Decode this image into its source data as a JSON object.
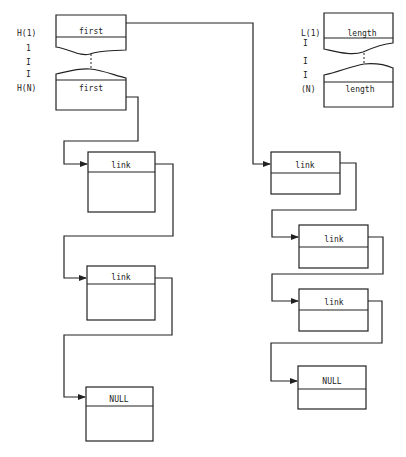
{
  "diagram": {
    "left_header": {
      "row_labels": [
        "H(1)",
        "1",
        "I",
        "I",
        "H(N)"
      ],
      "top_field": "first",
      "bottom_field": "first"
    },
    "right_header": {
      "row_labels": [
        "L(1)",
        "I",
        "I",
        "I",
        "(N)"
      ],
      "top_field": "length",
      "bottom_field": "length"
    },
    "left_chain": [
      {
        "field": "link"
      },
      {
        "field": "link"
      },
      {
        "field": "NULL"
      }
    ],
    "right_chain": [
      {
        "field": "link"
      },
      {
        "field": "link"
      },
      {
        "field": "link"
      },
      {
        "field": "NULL"
      }
    ],
    "colors": {
      "stroke": "#222222",
      "background": "#ffffff"
    }
  }
}
